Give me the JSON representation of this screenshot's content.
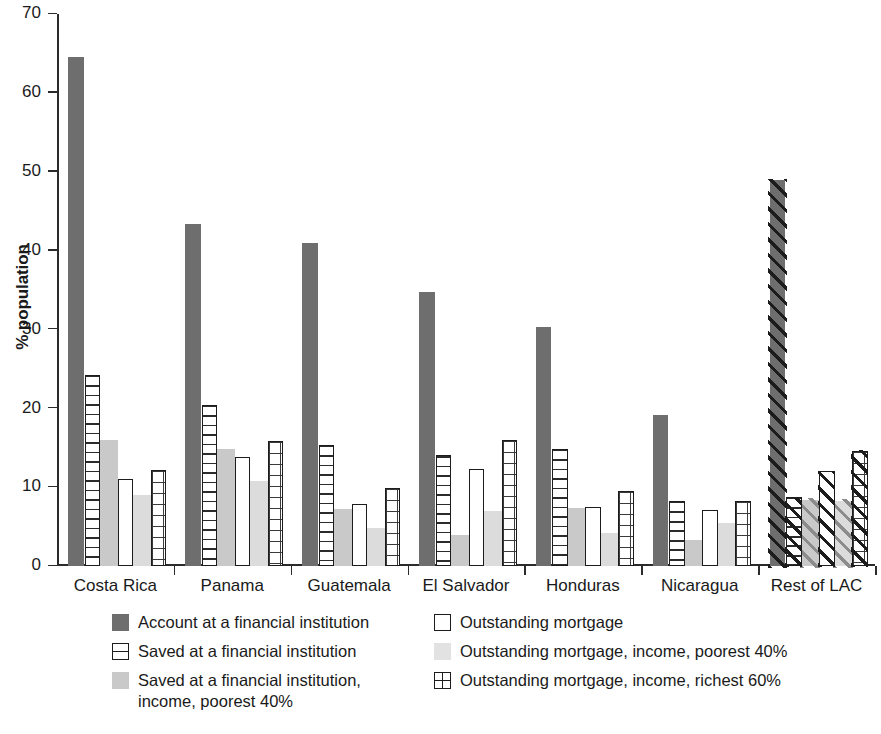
{
  "chart_data": {
    "type": "bar",
    "title": "",
    "subtitle": "",
    "xlabel": "",
    "ylabel": "% population",
    "ylim": [
      0,
      70
    ],
    "yticks": [
      0,
      10,
      20,
      30,
      40,
      50,
      60,
      70
    ],
    "ytick_labels": [
      "0",
      "10",
      "20",
      "30",
      "40",
      "50",
      "60",
      "70"
    ],
    "grid": false,
    "legend_position": "bottom",
    "categories": [
      "Costa Rica",
      "Panama",
      "Guatemala",
      "El Salvador",
      "Honduras",
      "Nicaragua",
      "Rest of LAC"
    ],
    "series": [
      {
        "name": "Account at a financial institution",
        "pattern": "solid-dark-gray",
        "color": "#6e6e6e",
        "values": [
          64.5,
          43.4,
          41.0,
          34.7,
          30.3,
          19.2,
          48.9
        ]
      },
      {
        "name": "Saved at a financial institution",
        "pattern": "horizontal-lines",
        "color": "#ffffff",
        "values": [
          24.2,
          20.4,
          15.3,
          14.1,
          14.8,
          8.3,
          8.7
        ]
      },
      {
        "name": "Saved at a financial institution, income, poorest 40%",
        "pattern": "solid-light-gray",
        "color": "#c9c9c9",
        "values": [
          16.0,
          14.9,
          7.2,
          3.9,
          7.3,
          3.3,
          8.4
        ]
      },
      {
        "name": "Outstanding mortgage",
        "pattern": "open-white",
        "color": "#ffffff",
        "values": [
          11.0,
          13.8,
          7.9,
          12.3,
          7.5,
          7.1,
          12.0
        ]
      },
      {
        "name": "Outstanding mortgage, income, poorest 40%",
        "pattern": "solid-pale-gray",
        "color": "#dcdcdc",
        "values": [
          9.0,
          10.8,
          4.8,
          7.0,
          4.2,
          5.5,
          8.3
        ]
      },
      {
        "name": "Outstanding mortgage, income, richest 60%",
        "pattern": "grid-lines",
        "color": "#ffffff",
        "values": [
          12.2,
          15.8,
          9.9,
          16.0,
          9.5,
          8.2,
          14.6
        ]
      }
    ]
  },
  "legend": {
    "left_column": [
      {
        "label": "Account at a financial institution",
        "swatch": "solid-dark-gray-swatch"
      },
      {
        "label": "Saved at a financial institution",
        "swatch": "horizontal-lines-swatch"
      },
      {
        "label": "Saved at a financial institution,\nincome, poorest 40%",
        "swatch": "solid-light-gray-swatch"
      }
    ],
    "right_column": [
      {
        "label": "Outstanding mortgage",
        "swatch": "open-white-swatch"
      },
      {
        "label": "Outstanding mortgage, income, poorest 40%",
        "swatch": "solid-pale-gray-swatch"
      },
      {
        "label": "Outstanding mortgage, income, richest 60%",
        "swatch": "grid-lines-swatch"
      }
    ]
  }
}
